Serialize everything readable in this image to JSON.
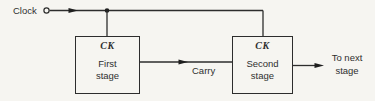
{
  "diagram": {
    "clock": {
      "label": "Clock"
    },
    "stages": [
      {
        "clock_pin": "CK",
        "name": [
          "First",
          "stage"
        ]
      },
      {
        "clock_pin": "CK",
        "name": [
          "Second",
          "stage"
        ]
      }
    ],
    "carry": {
      "label": "Carry"
    },
    "output": {
      "label": [
        "To next",
        "stage"
      ]
    },
    "colors": {
      "background": "#f6f5f1",
      "line": "#2d2d2d",
      "text": "#2f2f2f"
    }
  }
}
